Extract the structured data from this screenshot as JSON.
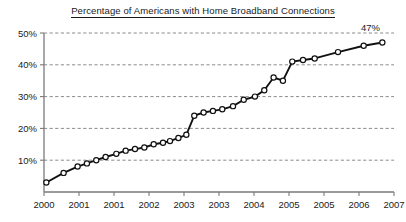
{
  "chart_data": {
    "type": "line",
    "title": "Percentage of Americans with Home Broadband Connections",
    "xlabel": "",
    "ylabel": "",
    "ylim": [
      0,
      50
    ],
    "xlim": [
      2000.0,
      2007.5
    ],
    "grid": true,
    "legend": false,
    "y_ticks": [
      "10%",
      "20%",
      "30%",
      "40%",
      "50%"
    ],
    "y_tick_values": [
      10,
      20,
      30,
      40,
      50
    ],
    "x_ticks": [
      "2000",
      "2001",
      "2001",
      "2002",
      "2003",
      "2003",
      "2004",
      "2005",
      "2005",
      "2006",
      "2007"
    ],
    "x_tick_values": [
      2000.0,
      2000.75,
      2001.5,
      2002.25,
      2003.0,
      2003.75,
      2004.5,
      2005.25,
      2006.0,
      2006.75,
      2007.5
    ],
    "annotations": [
      {
        "text": "47%",
        "x": 2007.5,
        "y": 47
      }
    ],
    "marker": "open-circle",
    "x": [
      2000.05,
      2000.42,
      2000.72,
      2000.92,
      2001.12,
      2001.32,
      2001.55,
      2001.75,
      2001.95,
      2002.15,
      2002.35,
      2002.55,
      2002.7,
      2002.88,
      2003.05,
      2003.22,
      2003.42,
      2003.62,
      2003.82,
      2004.05,
      2004.28,
      2004.52,
      2004.72,
      2004.92,
      2005.12,
      2005.32,
      2005.55,
      2005.8,
      2006.3,
      2006.85,
      2007.25
    ],
    "values": [
      3,
      6,
      8,
      9,
      10,
      11,
      12,
      13,
      13.5,
      14,
      15,
      15.5,
      16,
      17,
      18,
      24,
      25,
      25.5,
      26,
      27,
      29,
      30,
      32,
      36,
      35,
      41,
      41.5,
      42,
      44,
      46,
      47
    ],
    "series": [
      {
        "name": "Home broadband adoption",
        "values": [
          3,
          6,
          8,
          9,
          10,
          11,
          12,
          13,
          13.5,
          14,
          15,
          15.5,
          16,
          17,
          18,
          24,
          25,
          25.5,
          26,
          27,
          29,
          30,
          32,
          36,
          35,
          41,
          41.5,
          42,
          44,
          46,
          47
        ]
      }
    ],
    "colors": {
      "line": "#111111",
      "marker_fill": "#ffffff",
      "marker_stroke": "#111111",
      "grid": "#6e6e6e",
      "axis": "#7a7a7a",
      "text": "#1a1a1a",
      "background": "#ffffff"
    }
  }
}
